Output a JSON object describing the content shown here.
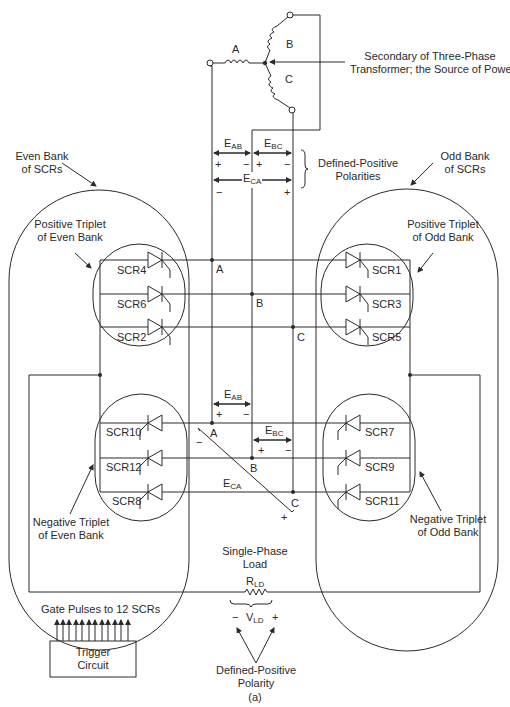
{
  "transformer": {
    "phase_a": "A",
    "phase_b": "B",
    "phase_c": "C",
    "label_line1": "Secondary of Three-Phase",
    "label_line2": "Transformer; the Source of Power"
  },
  "polarities_top": {
    "eab": "E",
    "eab_sub": "AB",
    "ebc": "E",
    "ebc_sub": "BC",
    "eca": "E",
    "eca_sub": "CA",
    "plus": "+",
    "minus": "−",
    "label_line1": "Defined-Positive",
    "label_line2": "Polarities"
  },
  "even_bank": {
    "label_line1": "Even Bank",
    "label_line2": "of SCRs",
    "positive_triplet_line1": "Positive Triplet",
    "positive_triplet_line2": "of Even Bank",
    "negative_triplet_line1": "Negative Triplet",
    "negative_triplet_line2": "of Even Bank",
    "positive_scrs": [
      "SCR4",
      "SCR6",
      "SCR2"
    ],
    "negative_scrs": [
      "SCR10",
      "SCR12",
      "SCR8"
    ]
  },
  "odd_bank": {
    "label_line1": "Odd Bank",
    "label_line2": "of SCRs",
    "positive_triplet_line1": "Positive Triplet",
    "positive_triplet_line2": "of Odd Bank",
    "negative_triplet_line1": "Negative Triplet",
    "negative_triplet_line2": "of Odd Bank",
    "positive_scrs": [
      "SCR1",
      "SCR3",
      "SCR5"
    ],
    "negative_scrs": [
      "SCR7",
      "SCR9",
      "SCR11"
    ]
  },
  "nodes": {
    "pos_a": "A",
    "pos_b": "B",
    "pos_c": "C",
    "neg_a": "A",
    "neg_b": "B",
    "neg_c": "C"
  },
  "polarities_mid": {
    "eab": "E",
    "eab_sub": "AB",
    "ebc": "E",
    "ebc_sub": "BC",
    "eca": "E",
    "eca_sub": "CA",
    "plus": "+",
    "minus": "−"
  },
  "load": {
    "label_line1": "Single-Phase",
    "label_line2": "Load",
    "r": "R",
    "r_sub": "LD",
    "v": "V",
    "v_sub": "LD",
    "minus": "−",
    "plus": "+",
    "polarity_line1": "Defined-Positive",
    "polarity_line2": "Polarity"
  },
  "trigger": {
    "pulses_label": "Gate Pulses to 12 SCRs",
    "box_line1": "Trigger",
    "box_line2": "Circuit",
    "pulse_count": 12
  },
  "caption": "(a)"
}
